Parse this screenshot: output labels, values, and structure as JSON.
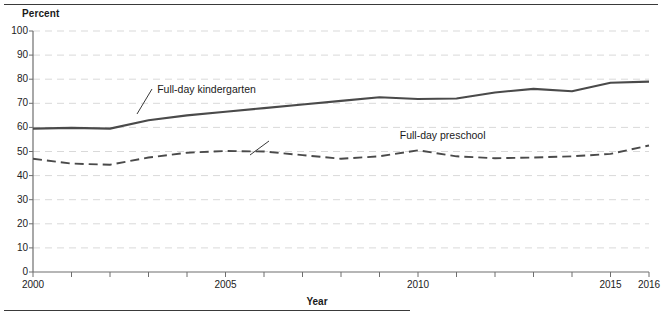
{
  "figure": {
    "y_axis_title": "Percent",
    "x_axis_title": "Year"
  },
  "chart_data": {
    "type": "line",
    "title": "",
    "xlabel": "Year",
    "ylabel": "Percent",
    "xlim": [
      2000,
      2016
    ],
    "ylim": [
      0,
      100
    ],
    "grid": "horizontal-dashed",
    "legend": "inline-annotations",
    "x": [
      2000,
      2001,
      2002,
      2003,
      2004,
      2005,
      2006,
      2007,
      2008,
      2009,
      2010,
      2011,
      2012,
      2013,
      2014,
      2015,
      2016
    ],
    "xticks": [
      2000,
      2001,
      2002,
      2003,
      2004,
      2005,
      2006,
      2007,
      2008,
      2009,
      2010,
      2011,
      2012,
      2013,
      2014,
      2015,
      2016
    ],
    "xtick_labels": [
      "2000",
      "",
      "",
      "",
      "",
      "2005",
      "",
      "",
      "",
      "",
      "2010",
      "",
      "",
      "",
      "",
      "2015",
      "2016"
    ],
    "yticks": [
      0,
      10,
      20,
      30,
      40,
      50,
      60,
      70,
      80,
      90,
      100
    ],
    "ytick_labels": [
      "0",
      "10",
      "20",
      "30",
      "40",
      "50",
      "60",
      "70",
      "80",
      "90",
      "100"
    ],
    "series": [
      {
        "name": "Full-day kindergarten",
        "style": "solid",
        "color": "#4a4a4a",
        "values": [
          59.5,
          59.8,
          59.5,
          63.0,
          65.0,
          66.5,
          68.0,
          69.5,
          71.0,
          72.5,
          71.8,
          72.0,
          74.5,
          76.0,
          75.0,
          78.5,
          79.0
        ]
      },
      {
        "name": "Full-day preschool",
        "style": "dashed",
        "color": "#4a4a4a",
        "values": [
          47.0,
          45.0,
          44.5,
          47.5,
          49.5,
          50.2,
          50.0,
          48.5,
          47.0,
          48.0,
          50.5,
          48.0,
          47.2,
          47.5,
          48.0,
          49.0,
          52.5
        ]
      }
    ],
    "annotations": [
      {
        "text": "Full-day kindergarten",
        "x": 2003.2,
        "y": 76
      },
      {
        "text": "Full-day preschool",
        "x": 2009.5,
        "y": 57
      }
    ]
  }
}
